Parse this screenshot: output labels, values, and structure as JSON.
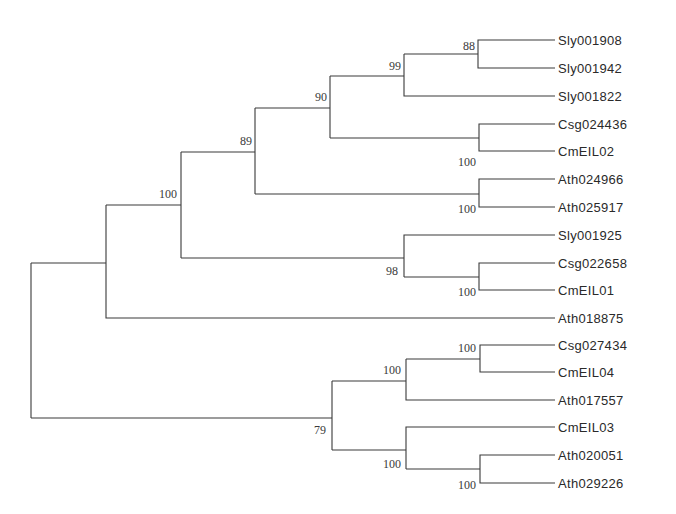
{
  "tree": {
    "type": "phylogenetic-tree",
    "leaves": [
      {
        "name": "Sly001908",
        "y": 40
      },
      {
        "name": "Sly001942",
        "y": 68
      },
      {
        "name": "Sly001822",
        "y": 96
      },
      {
        "name": "Csg024436",
        "y": 124
      },
      {
        "name": "CmEIL02",
        "y": 151
      },
      {
        "name": "Ath024966",
        "y": 179
      },
      {
        "name": "Ath025917",
        "y": 207
      },
      {
        "name": "Sly001925",
        "y": 235
      },
      {
        "name": "Csg022658",
        "y": 263
      },
      {
        "name": "CmEIL01",
        "y": 290
      },
      {
        "name": "Ath018875",
        "y": 318
      },
      {
        "name": "Csg027434",
        "y": 345
      },
      {
        "name": "CmEIL04",
        "y": 372
      },
      {
        "name": "Ath017557",
        "y": 400
      },
      {
        "name": "CmEIL03",
        "y": 427
      },
      {
        "name": "Ath020051",
        "y": 455
      },
      {
        "name": "Ath029226",
        "y": 483
      }
    ],
    "bootstrap": [
      {
        "value": "88",
        "x": 468,
        "y": 51
      },
      {
        "value": "99",
        "x": 394,
        "y": 70
      },
      {
        "value": "90",
        "x": 320,
        "y": 100
      },
      {
        "value": "89",
        "x": 245,
        "y": 145
      },
      {
        "value": "100",
        "x": 170,
        "y": 196
      },
      {
        "value": "100",
        "x": 469,
        "y": 167
      },
      {
        "value": "100",
        "x": 469,
        "y": 213
      },
      {
        "value": "98",
        "x": 396,
        "y": 273
      },
      {
        "value": "100",
        "x": 469,
        "y": 295
      },
      {
        "value": "100",
        "x": 396,
        "y": 375
      },
      {
        "value": "100",
        "x": 469,
        "y": 351
      },
      {
        "value": "79",
        "x": 322,
        "y": 435
      },
      {
        "value": "100",
        "x": 396,
        "y": 468
      },
      {
        "value": "100",
        "x": 469,
        "y": 488
      }
    ]
  }
}
